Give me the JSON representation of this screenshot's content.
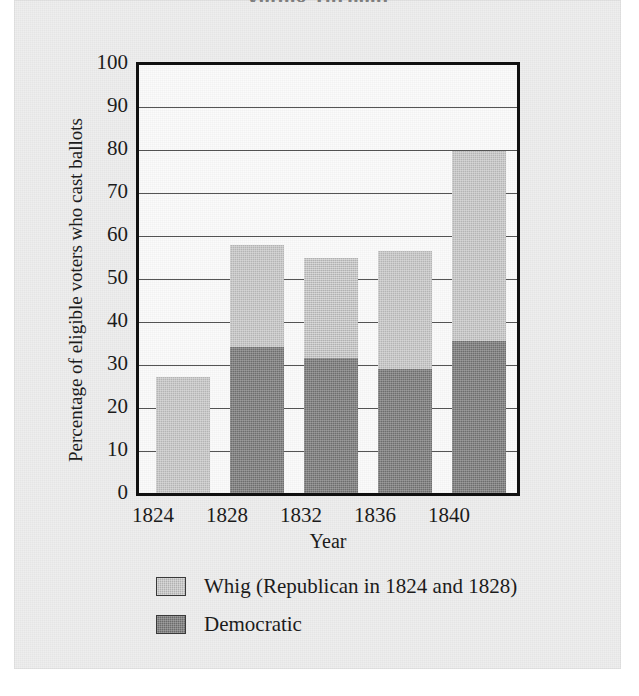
{
  "figure": {
    "title": "Voting Turnout",
    "background_color": "#eeeeee",
    "plot_background_color": "#fbfbfb",
    "frame_color": "#111111"
  },
  "axes": {
    "ylabel": "Percentage of eligible voters who cast ballots",
    "xlabel": "Year",
    "yticks": [
      "100",
      "90",
      "80",
      "70",
      "60",
      "50",
      "40",
      "30",
      "20",
      "10",
      "0"
    ],
    "xticks": [
      "1824",
      "1828",
      "1832",
      "1836",
      "1840"
    ]
  },
  "legend": {
    "items": [
      {
        "label": "Whig (Republican in 1824 and 1828)",
        "color": "#b4b4b4"
      },
      {
        "label": "Democratic",
        "color": "#6d6d6d"
      }
    ]
  },
  "chart_data": {
    "type": "bar",
    "stacked": true,
    "title": "Voting Turnout",
    "xlabel": "Year",
    "ylabel": "Percentage of eligible voters who cast ballots",
    "categories": [
      "1824",
      "1828",
      "1832",
      "1836",
      "1840"
    ],
    "ylim": [
      0,
      100
    ],
    "ytick_step": 10,
    "grid": true,
    "grid_axis": "y",
    "legend_position": "below-plot-left",
    "series": [
      {
        "name": "Democratic",
        "color": "#6d6d6d",
        "values": [
          0,
          34,
          31.5,
          29,
          35.5
        ]
      },
      {
        "name": "Whig (Republican in 1824 and 1828)",
        "color": "#b4b4b4",
        "values": [
          27,
          24,
          23.5,
          27.5,
          44.5
        ]
      }
    ],
    "totals": [
      27,
      58,
      55,
      56.5,
      80
    ]
  }
}
